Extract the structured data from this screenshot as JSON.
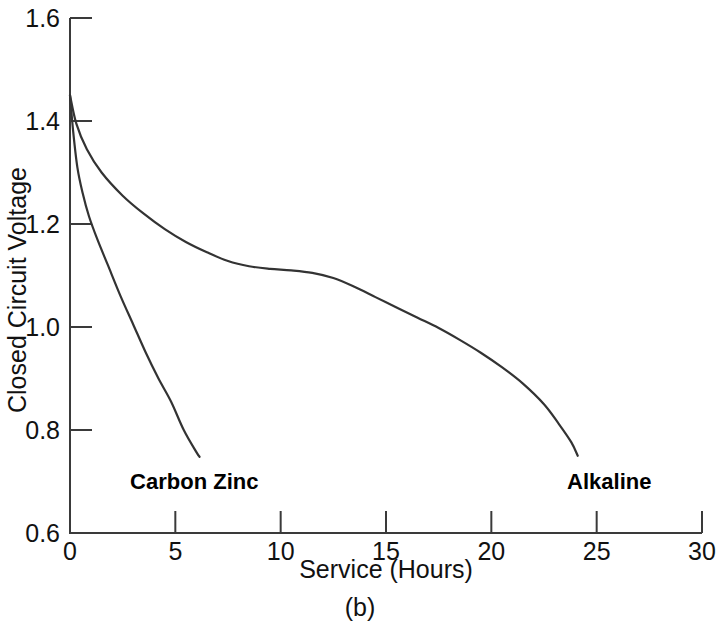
{
  "chart_data": {
    "type": "line",
    "title": "",
    "caption": "(b)",
    "xlabel": "Service (Hours)",
    "ylabel": "Closed Circuit Voltage",
    "xlim": [
      0,
      30
    ],
    "ylim": [
      0.6,
      1.6
    ],
    "xticks": [
      0,
      5,
      10,
      15,
      20,
      25,
      30
    ],
    "xtick_labels": [
      "0",
      "5",
      "10",
      "15",
      "20",
      "25",
      "30"
    ],
    "yticks": [
      0.6,
      0.8,
      1.0,
      1.2,
      1.4,
      1.6
    ],
    "ytick_labels": [
      "0.6",
      "0.8",
      "1.0",
      "1.2",
      "1.4",
      "1.6"
    ],
    "grid": false,
    "legend": "inline-annotations",
    "series": [
      {
        "name": "Carbon Zinc",
        "label_x": 5.9,
        "label_y": 0.685,
        "x": [
          0.0,
          0.15,
          0.35,
          0.6,
          0.9,
          1.3,
          1.8,
          2.4,
          3.0,
          3.6,
          4.2,
          4.8,
          5.4,
          6.0,
          6.15
        ],
        "y": [
          1.45,
          1.38,
          1.31,
          1.26,
          1.215,
          1.17,
          1.12,
          1.06,
          1.005,
          0.95,
          0.9,
          0.855,
          0.8,
          0.757,
          0.748
        ]
      },
      {
        "name": "Alkaline",
        "label_x": 25.6,
        "label_y": 0.685,
        "x": [
          0.0,
          0.3,
          0.8,
          1.5,
          2.5,
          3.5,
          4.5,
          5.5,
          6.5,
          7.5,
          8.5,
          9.5,
          10.5,
          11.5,
          12.5,
          13.5,
          14.5,
          15.5,
          16.5,
          17.5,
          18.5,
          19.5,
          20.5,
          21.5,
          22.5,
          23.2,
          23.8,
          24.1
        ],
        "y": [
          1.45,
          1.395,
          1.345,
          1.3,
          1.255,
          1.22,
          1.19,
          1.165,
          1.145,
          1.128,
          1.118,
          1.113,
          1.11,
          1.105,
          1.095,
          1.078,
          1.058,
          1.038,
          1.018,
          0.998,
          0.975,
          0.95,
          0.922,
          0.89,
          0.85,
          0.812,
          0.776,
          0.75
        ]
      }
    ]
  },
  "axis_geometry": {
    "left_px": 70,
    "right_px": 702,
    "top_px": 18,
    "bottom_px": 533
  }
}
